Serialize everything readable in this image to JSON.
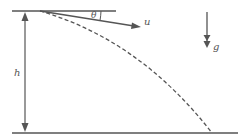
{
  "diagram": {
    "labels": {
      "angle": "θ",
      "velocity": "u",
      "height": "h",
      "gravity": "g"
    },
    "colors": {
      "line": "#555555",
      "background": "#ffffff"
    },
    "elements": [
      {
        "id": "top-line",
        "type": "horizontal line",
        "description": "reference horizontal at launch height"
      },
      {
        "id": "ground-line",
        "type": "horizontal line",
        "description": "ground level"
      },
      {
        "id": "height-arrow",
        "type": "double-headed arrow",
        "label": "h"
      },
      {
        "id": "velocity-arrow",
        "type": "arrow",
        "label": "u",
        "angle_label": "θ"
      },
      {
        "id": "trajectory",
        "type": "dashed curve",
        "description": "parabolic path"
      },
      {
        "id": "gravity-arrow",
        "type": "arrow",
        "label": "g"
      }
    ]
  }
}
